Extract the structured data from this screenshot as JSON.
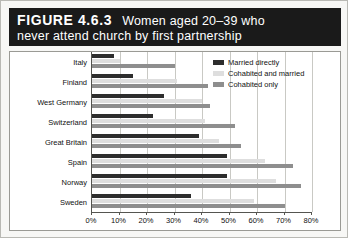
{
  "figure": {
    "number": "FIGURE 4.6.3",
    "title_line1": "Women aged 20–39 who",
    "title_line2": "never attend church by first partnership"
  },
  "colors": {
    "title_bar_bg": "#1a1a1a",
    "title_text": "#ffffff",
    "series_married_directly": "#2d2d2d",
    "series_cohabited_and_married": "#dedede",
    "series_cohabited_only": "#8e8e8e",
    "axis": "#555550",
    "grid": "#c9c9c4",
    "page_bg": "#f7f7f5",
    "plot_bg": "#ffffff"
  },
  "legend": {
    "position": "top-right",
    "items": [
      {
        "label": "Married directly",
        "color": "#2d2d2d"
      },
      {
        "label": "Cohabited and married",
        "color": "#dedede"
      },
      {
        "label": "Cohabited only",
        "color": "#8e8e8e"
      }
    ]
  },
  "chart_data": {
    "type": "bar",
    "orientation": "horizontal",
    "xlabel": "",
    "ylabel": "",
    "xlim": [
      0,
      80
    ],
    "xticks": [
      0,
      10,
      20,
      30,
      40,
      50,
      60,
      70,
      80
    ],
    "xtick_labels": [
      "0%",
      "10%",
      "20%",
      "30%",
      "40%",
      "50%",
      "60%",
      "70%",
      "80%"
    ],
    "grid": true,
    "grid_axis": "x",
    "legend_position": "top-right",
    "categories": [
      "Italy",
      "Finland",
      "West Germany",
      "Switzerland",
      "Great Britain",
      "Spain",
      "Norway",
      "Sweden"
    ],
    "series": [
      {
        "name": "Married directly",
        "color": "#2d2d2d",
        "values": [
          8,
          15,
          26,
          22,
          39,
          49,
          49,
          36
        ]
      },
      {
        "name": "Cohabited and married",
        "color": "#dedede",
        "values": [
          10,
          31,
          40,
          41,
          46,
          63,
          67,
          59
        ]
      },
      {
        "name": "Cohabited only",
        "color": "#8e8e8e",
        "values": [
          30,
          42,
          43,
          52,
          54,
          73,
          76,
          70
        ]
      }
    ]
  }
}
